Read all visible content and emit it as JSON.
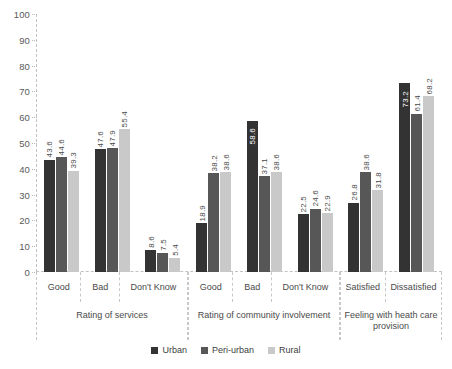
{
  "chart_data": {
    "type": "bar",
    "title": "",
    "xlabel": "",
    "ylabel": "",
    "ylim": [
      0,
      100
    ],
    "ytick_step": 10,
    "grid": true,
    "legend_position": "bottom",
    "yticks": [
      "100",
      "90",
      "80",
      "70",
      "60",
      "50",
      "40",
      "30",
      "20",
      "10",
      "0"
    ],
    "series": [
      {
        "name": "Urban",
        "color": "#333333",
        "values": [
          43.6,
          47.6,
          8.6,
          18.9,
          58.6,
          22.5,
          26.8,
          73.2
        ]
      },
      {
        "name": "Peri-urban",
        "color": "#575757",
        "values": [
          44.6,
          47.9,
          7.5,
          38.2,
          37.1,
          24.6,
          38.6,
          61.4
        ]
      },
      {
        "name": "Rural",
        "color": "#c9c9c9",
        "values": [
          39.3,
          55.4,
          5.4,
          38.6,
          38.6,
          22.9,
          31.8,
          68.2
        ]
      }
    ],
    "categories": [
      "Good",
      "Bad",
      "Don't Know",
      "Good",
      "Bad",
      "Don't Know",
      "Satisfied",
      "Dissatisfied"
    ],
    "sections": [
      {
        "title": "Rating of services",
        "categories": [
          "Good",
          "Bad",
          "Don't Know"
        ]
      },
      {
        "title": "Rating of community involvement",
        "categories": [
          "Good",
          "Bad",
          "Don't Know"
        ]
      },
      {
        "title": "Feeling with heath care provision",
        "categories": [
          "Satisfied",
          "Dissatisfied"
        ]
      }
    ],
    "groups": [
      {
        "section": 0,
        "category": "Good",
        "bars": [
          {
            "series": "Urban",
            "value": 43.6,
            "label": "43.6"
          },
          {
            "series": "Peri-urban",
            "value": 44.6,
            "label": "44.6"
          },
          {
            "series": "Rural",
            "value": 39.3,
            "label": "39.3"
          }
        ]
      },
      {
        "section": 0,
        "category": "Bad",
        "bars": [
          {
            "series": "Urban",
            "value": 47.6,
            "label": "47.6"
          },
          {
            "series": "Peri-urban",
            "value": 47.9,
            "label": "47.9"
          },
          {
            "series": "Rural",
            "value": 55.4,
            "label": "55.4"
          }
        ]
      },
      {
        "section": 0,
        "category": "Don't Know",
        "bars": [
          {
            "series": "Urban",
            "value": 8.6,
            "label": "8.6"
          },
          {
            "series": "Peri-urban",
            "value": 7.5,
            "label": "7.5"
          },
          {
            "series": "Rural",
            "value": 5.4,
            "label": "5.4"
          }
        ]
      },
      {
        "section": 1,
        "category": "Good",
        "bars": [
          {
            "series": "Urban",
            "value": 18.9,
            "label": "18.9"
          },
          {
            "series": "Peri-urban",
            "value": 38.2,
            "label": "38.2"
          },
          {
            "series": "Rural",
            "value": 38.6,
            "label": "38.6"
          }
        ]
      },
      {
        "section": 1,
        "category": "Bad",
        "bars": [
          {
            "series": "Urban",
            "value": 58.6,
            "label": "58.6"
          },
          {
            "series": "Peri-urban",
            "value": 37.1,
            "label": "37.1"
          },
          {
            "series": "Rural",
            "value": 38.6,
            "label": "38.6"
          }
        ]
      },
      {
        "section": 1,
        "category": "Don't Know",
        "bars": [
          {
            "series": "Urban",
            "value": 22.5,
            "label": "22.5"
          },
          {
            "series": "Peri-urban",
            "value": 24.6,
            "label": "24.6"
          },
          {
            "series": "Rural",
            "value": 22.9,
            "label": "22.9"
          }
        ]
      },
      {
        "section": 2,
        "category": "Satisfied",
        "bars": [
          {
            "series": "Urban",
            "value": 26.8,
            "label": "26.8"
          },
          {
            "series": "Peri-urban",
            "value": 38.6,
            "label": "38.6"
          },
          {
            "series": "Rural",
            "value": 31.8,
            "label": "31.8"
          }
        ]
      },
      {
        "section": 2,
        "category": "Dissatisfied",
        "bars": [
          {
            "series": "Urban",
            "value": 73.2,
            "label": "73.2"
          },
          {
            "series": "Peri-urban",
            "value": 61.4,
            "label": "61.4"
          },
          {
            "series": "Rural",
            "value": 68.2,
            "label": "68.2"
          }
        ]
      }
    ],
    "legend": [
      {
        "label": "Urban",
        "color": "#333333"
      },
      {
        "label": "Peri-urban",
        "color": "#575757"
      },
      {
        "label": "Rural",
        "color": "#c9c9c9"
      }
    ]
  }
}
